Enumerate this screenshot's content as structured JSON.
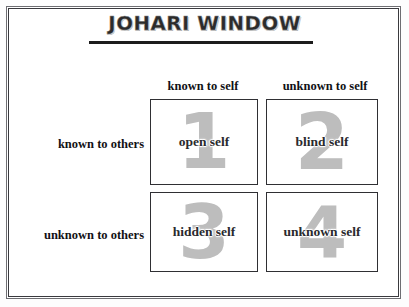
{
  "diagram": {
    "title": "JOHARI WINDOW",
    "column_headers": [
      {
        "id": "known-to-self",
        "label": "known to self"
      },
      {
        "id": "unknown-to-self",
        "label": "unknown to self"
      }
    ],
    "row_headers": [
      {
        "id": "known-to-others",
        "label": "known to others"
      },
      {
        "id": "unknown-to-others",
        "label": "unknown to others"
      }
    ],
    "quadrants": [
      {
        "id": "open-self",
        "number": "1",
        "label": "open self"
      },
      {
        "id": "blind-self",
        "number": "2",
        "label": "blind self"
      },
      {
        "id": "hidden-self",
        "number": "3",
        "label": "hidden self"
      },
      {
        "id": "unknown-self",
        "number": "4",
        "label": "unknown self"
      }
    ],
    "colors": {
      "frame_outer": "#6e6e72",
      "frame_inner": "#3a3a3e",
      "quadrant_border": "#2f2f33",
      "watermark_number": "#bdbdbd",
      "text": "#111115",
      "title_rule": "#1c1c1c",
      "background": "#ffffff"
    }
  }
}
